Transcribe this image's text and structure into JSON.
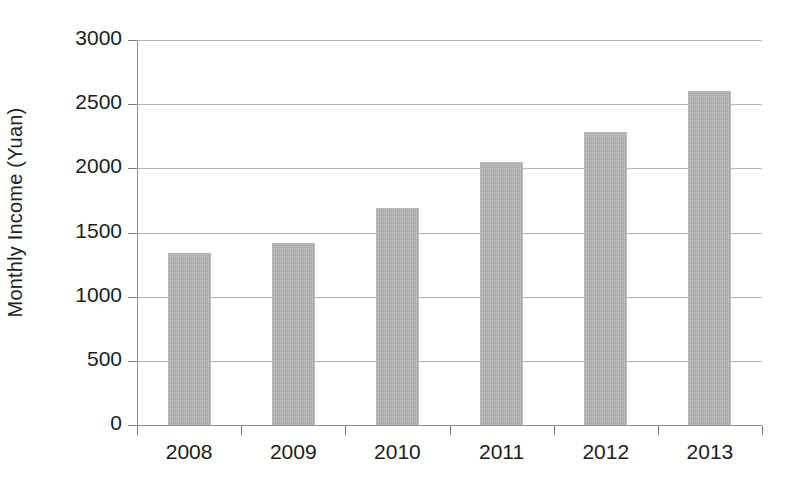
{
  "chart_data": {
    "type": "bar",
    "title": "",
    "subtitle": "",
    "xlabel": "",
    "ylabel": "Monthly Income (Yuan)",
    "categories": [
      "2008",
      "2009",
      "2010",
      "2011",
      "2012",
      "2013"
    ],
    "values": [
      1340,
      1420,
      1690,
      2050,
      2280,
      2600
    ],
    "series": [
      {
        "name": "Monthly Income",
        "values": [
          1340,
          1420,
          1690,
          2050,
          2280,
          2600
        ]
      }
    ],
    "ylim": [
      0,
      3000
    ],
    "y_ticks": [
      0,
      500,
      1000,
      1500,
      2000,
      2500,
      3000
    ],
    "y_tick_labels": [
      "0",
      "500",
      "1000",
      "1500",
      "2000",
      "2500",
      "3000"
    ],
    "grid": true,
    "grid_axis": "y",
    "legend": false,
    "legend_position": "none",
    "bar_color": "#a9a9a9",
    "grid_color": "#b4b4b4",
    "axis_color": "#8f8f8f",
    "text_color": "#1c1c1c",
    "background_color": "#ffffff",
    "annotations": []
  }
}
